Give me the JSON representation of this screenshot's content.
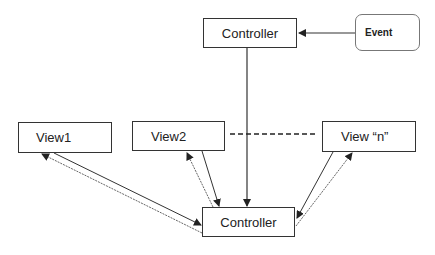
{
  "nodes": {
    "top_controller": {
      "label": "Controller"
    },
    "event": {
      "label": "Event"
    },
    "view1": {
      "label": "View1"
    },
    "view2": {
      "label": "View2"
    },
    "viewn": {
      "label": "View “n”"
    },
    "bottom_controller": {
      "label": "Controller"
    }
  },
  "edges": [
    {
      "from": "event",
      "to": "top_controller",
      "style": "solid"
    },
    {
      "from": "top_controller",
      "to": "bottom_controller",
      "style": "solid"
    },
    {
      "from": "view1",
      "to": "bottom_controller",
      "style": "solid"
    },
    {
      "from": "bottom_controller",
      "to": "view1",
      "style": "dotted"
    },
    {
      "from": "view2",
      "to": "bottom_controller",
      "style": "solid"
    },
    {
      "from": "bottom_controller",
      "to": "view2",
      "style": "dotted"
    },
    {
      "from": "viewn",
      "to": "bottom_controller",
      "style": "solid"
    },
    {
      "from": "bottom_controller",
      "to": "viewn",
      "style": "dotted"
    },
    {
      "from": "view2",
      "to": "viewn",
      "style": "dashed",
      "meaning": "continuation"
    }
  ]
}
